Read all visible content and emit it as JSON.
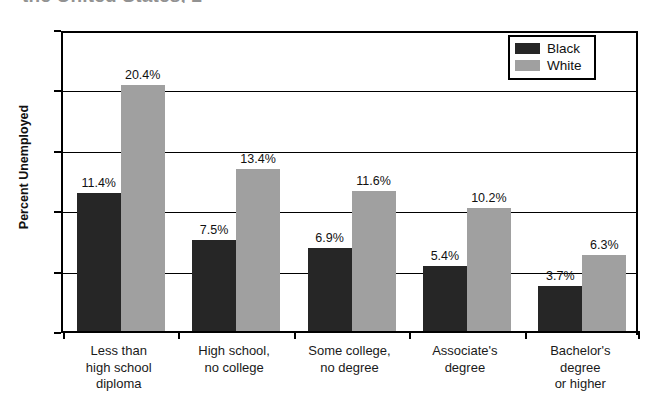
{
  "title": {
    "visible_fragment": "the United States, 2",
    "note_clipped": true
  },
  "legend": {
    "position": "top-right-inside",
    "entries": [
      {
        "label": "Black",
        "color": "#262626"
      },
      {
        "label": "White",
        "color": "#a0a0a0"
      }
    ]
  },
  "y_axis": {
    "label": "Percent Unemployed",
    "ticks": [
      "0",
      "5",
      "10",
      "15",
      "20",
      "25"
    ]
  },
  "x_axis": {
    "categories": [
      {
        "lines": [
          "Less than",
          "high school",
          "diploma"
        ]
      },
      {
        "lines": [
          "High school,",
          "no college"
        ]
      },
      {
        "lines": [
          "Some college,",
          "no degree"
        ]
      },
      {
        "lines": [
          "Associate's",
          "degree"
        ]
      },
      {
        "lines": [
          "Bachelor's",
          "degree",
          "or higher"
        ]
      }
    ]
  },
  "bar_labels": {
    "black": [
      "11.4%",
      "7.5%",
      "6.9%",
      "5.4%",
      "3.7%"
    ],
    "white": [
      "20.4%",
      "13.4%",
      "11.6%",
      "10.2%",
      "6.3%"
    ]
  },
  "chart_data": {
    "type": "bar",
    "title": "the United States, 2",
    "xlabel": "",
    "ylabel": "Percent Unemployed",
    "ylim": [
      0,
      25
    ],
    "yticks": [
      0,
      5,
      10,
      15,
      20,
      25
    ],
    "grid": true,
    "legend_position": "upper right",
    "categories": [
      "Less than high school diploma",
      "High school, no college",
      "Some college, no degree",
      "Associate's degree",
      "Bachelor's degree or higher"
    ],
    "series": [
      {
        "name": "Black",
        "color": "#262626",
        "values": [
          11.4,
          7.5,
          6.9,
          5.4,
          3.7
        ]
      },
      {
        "name": "White",
        "color": "#a0a0a0",
        "values": [
          20.4,
          13.4,
          11.6,
          10.2,
          6.3
        ]
      }
    ],
    "value_format": "percent"
  }
}
